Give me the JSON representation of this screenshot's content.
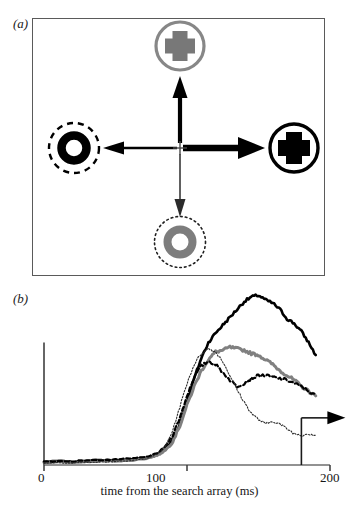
{
  "figure": {
    "panels": [
      {
        "id": "a",
        "label": "(a)"
      },
      {
        "id": "b",
        "label": "(b)"
      }
    ]
  },
  "panel_a": {
    "label": "(a)",
    "description": "visual search array with four peripheral stimuli and arrows from central fixation",
    "fixation": {
      "name": "fixation-cross",
      "color": "#2b2b2b"
    },
    "stimuli": [
      {
        "position": "top",
        "name": "gray-plus-in-gray-circle",
        "shape": "plus",
        "shape_color": "#808080",
        "surround": "solid-circle",
        "surround_color": "#808080",
        "surround_style": "solid"
      },
      {
        "position": "right",
        "name": "black-plus-in-black-circle",
        "shape": "plus",
        "shape_color": "#000000",
        "surround": "solid-circle",
        "surround_color": "#000000",
        "surround_style": "solid"
      },
      {
        "position": "left",
        "name": "black-ring-in-dashed-circle",
        "shape": "ring",
        "shape_color": "#000000",
        "surround": "dashed-circle",
        "surround_color": "#000000",
        "surround_style": "dashed"
      },
      {
        "position": "bottom",
        "name": "gray-ring-in-dotted-circle",
        "shape": "ring",
        "shape_color": "#808080",
        "surround": "dotted-circle",
        "surround_color": "#1a1a1a",
        "surround_style": "dotted"
      }
    ],
    "arrows": [
      {
        "direction": "up",
        "name": "arrow-up",
        "weight": "thick",
        "color": "#000000"
      },
      {
        "direction": "right",
        "name": "arrow-right",
        "weight": "thickest",
        "color": "#000000"
      },
      {
        "direction": "left",
        "name": "arrow-left",
        "weight": "medium",
        "color": "#000000"
      },
      {
        "direction": "down",
        "name": "arrow-down",
        "weight": "thin",
        "color": "#2b2b2b"
      }
    ]
  },
  "panel_b": {
    "label": "(b)"
  },
  "chart_data": {
    "type": "line",
    "title": "",
    "xlabel": "time from the search array (ms)",
    "ylabel": "",
    "xlim": [
      0,
      200
    ],
    "ylim": [
      0,
      1.12
    ],
    "xticks": [
      0,
      100,
      200
    ],
    "xtick_labels": [
      "0",
      "100",
      "200"
    ],
    "yticks": [],
    "grid": false,
    "legend": "none",
    "y_axis_bar": {
      "name": "activity-scale-bar",
      "note": "unlabelled vertical scale bar"
    },
    "annotations": [
      {
        "name": "saccade-onset-arrow",
        "type": "right-arrow-with-riser",
        "x": 180,
        "note": "arrow marking saccade direction at x=180"
      }
    ],
    "series": [
      {
        "name": "thick-black-solid",
        "style": "solid",
        "color": "#000000",
        "width": 2.6,
        "x": [
          0,
          10,
          20,
          30,
          40,
          50,
          60,
          70,
          75,
          80,
          85,
          90,
          95,
          100,
          105,
          110,
          115,
          120,
          125,
          130,
          135,
          140,
          145,
          150,
          155,
          160,
          165,
          170,
          175,
          180,
          185,
          190
        ],
        "values": [
          0.02,
          0.025,
          0.02,
          0.028,
          0.03,
          0.03,
          0.035,
          0.045,
          0.055,
          0.07,
          0.1,
          0.16,
          0.26,
          0.4,
          0.55,
          0.68,
          0.78,
          0.84,
          0.89,
          0.94,
          0.99,
          1.04,
          1.07,
          1.08,
          1.05,
          1.03,
          0.99,
          0.93,
          0.9,
          0.85,
          0.78,
          0.7
        ]
      },
      {
        "name": "thick-gray-solid",
        "style": "solid",
        "color": "#808080",
        "width": 3.0,
        "x": [
          0,
          10,
          20,
          30,
          40,
          50,
          60,
          70,
          75,
          80,
          85,
          90,
          95,
          100,
          105,
          110,
          115,
          120,
          125,
          130,
          135,
          140,
          145,
          150,
          155,
          160,
          165,
          170,
          175,
          180,
          185,
          190
        ],
        "values": [
          0.015,
          0.02,
          0.018,
          0.022,
          0.025,
          0.027,
          0.03,
          0.04,
          0.05,
          0.065,
          0.095,
          0.15,
          0.25,
          0.38,
          0.5,
          0.6,
          0.67,
          0.72,
          0.73,
          0.75,
          0.74,
          0.73,
          0.71,
          0.7,
          0.67,
          0.64,
          0.6,
          0.57,
          0.54,
          0.5,
          0.47,
          0.44
        ]
      },
      {
        "name": "black-dashed",
        "style": "dashed",
        "color": "#000000",
        "width": 2.2,
        "x": [
          0,
          10,
          20,
          30,
          40,
          50,
          60,
          70,
          75,
          80,
          85,
          90,
          95,
          100,
          105,
          110,
          115,
          120,
          125,
          130,
          135,
          140,
          145,
          150,
          155,
          160,
          165,
          170,
          175,
          180,
          185,
          190
        ],
        "values": [
          0.02,
          0.025,
          0.022,
          0.03,
          0.032,
          0.035,
          0.04,
          0.05,
          0.06,
          0.08,
          0.12,
          0.19,
          0.3,
          0.44,
          0.56,
          0.63,
          0.66,
          0.64,
          0.59,
          0.54,
          0.5,
          0.52,
          0.55,
          0.57,
          0.57,
          0.56,
          0.55,
          0.54,
          0.52,
          0.5,
          0.47,
          0.44
        ]
      },
      {
        "name": "fine-dotted",
        "style": "dotted",
        "color": "#2b2b2b",
        "width": 1.1,
        "x": [
          0,
          10,
          20,
          30,
          40,
          50,
          60,
          70,
          75,
          80,
          85,
          90,
          95,
          100,
          105,
          110,
          115,
          120,
          125,
          130,
          135,
          140,
          145,
          150,
          155,
          160,
          165,
          170,
          175,
          180,
          185,
          190
        ],
        "values": [
          0.01,
          0.015,
          0.012,
          0.018,
          0.02,
          0.022,
          0.026,
          0.038,
          0.05,
          0.075,
          0.12,
          0.22,
          0.37,
          0.52,
          0.64,
          0.71,
          0.74,
          0.72,
          0.66,
          0.57,
          0.48,
          0.4,
          0.33,
          0.29,
          0.26,
          0.28,
          0.26,
          0.23,
          0.2,
          0.19,
          0.2,
          0.19
        ]
      }
    ]
  }
}
